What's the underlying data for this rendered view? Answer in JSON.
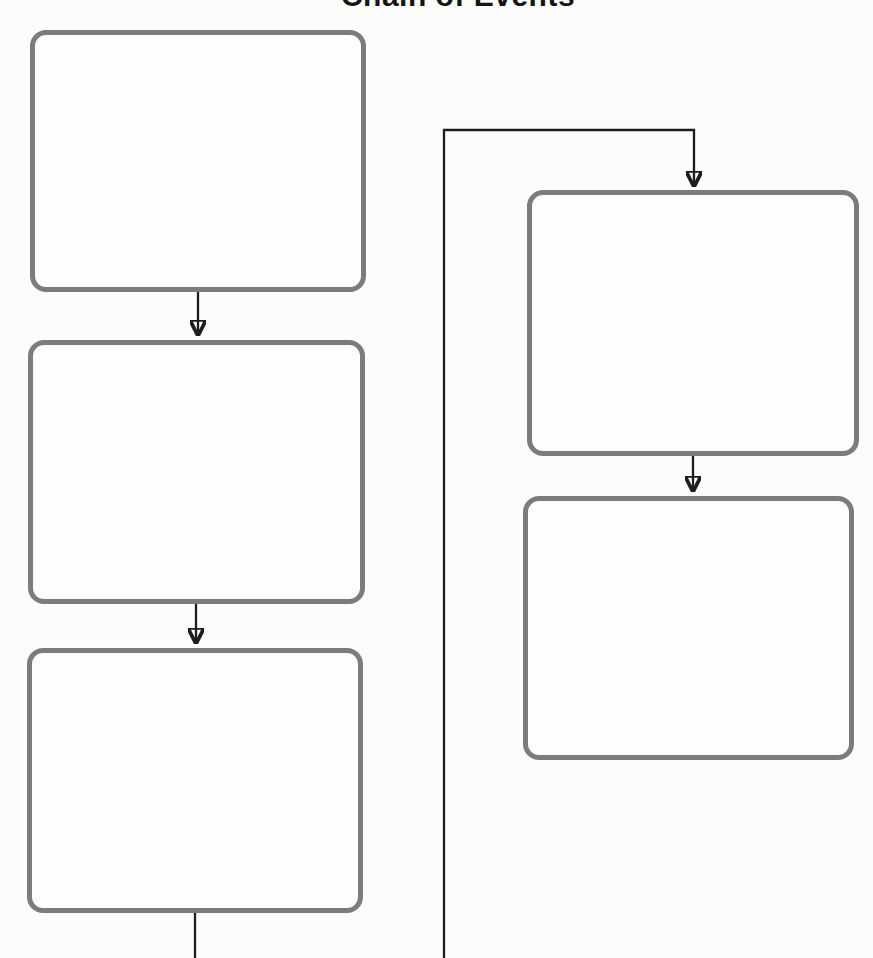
{
  "title": "Chain of Events",
  "boxes": [
    {
      "id": "event-1",
      "position": "left-top",
      "label": ""
    },
    {
      "id": "event-2",
      "position": "left-middle",
      "label": ""
    },
    {
      "id": "event-3",
      "position": "left-bottom",
      "label": ""
    },
    {
      "id": "event-4",
      "position": "right-top",
      "label": ""
    },
    {
      "id": "event-5",
      "position": "right-middle",
      "label": ""
    }
  ],
  "connectors": [
    {
      "from": "event-1",
      "to": "event-2",
      "type": "arrow"
    },
    {
      "from": "event-2",
      "to": "event-3",
      "type": "arrow"
    },
    {
      "from": "event-3",
      "to": "off-canvas-bottom",
      "type": "line-cut-off"
    },
    {
      "from": "off-canvas-bottom",
      "to": "event-4",
      "type": "wraparound-arrow"
    },
    {
      "from": "event-4",
      "to": "event-5",
      "type": "arrow"
    }
  ],
  "colors": {
    "box_border": "#7c7c7c",
    "connector": "#1d1d1d",
    "background": "#fcfcfb",
    "title": "#151515"
  }
}
